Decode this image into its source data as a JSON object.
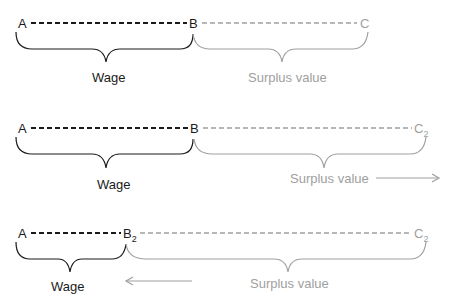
{
  "colors": {
    "wage": "#1a1a1a",
    "surplus": "#a0a0a0"
  },
  "rows": [
    {
      "point_a": "A",
      "point_b": "B",
      "point_b_sub": "",
      "point_c": "C",
      "point_c_sub": "",
      "wage_label": "Wage",
      "surplus_label": "Surplus value",
      "arrow": "none"
    },
    {
      "point_a": "A",
      "point_b": "B",
      "point_b_sub": "",
      "point_c": "C",
      "point_c_sub": "2",
      "wage_label": "Wage",
      "surplus_label": "Surplus value",
      "arrow": "right"
    },
    {
      "point_a": "A",
      "point_b": "B",
      "point_b_sub": "2",
      "point_c": "C",
      "point_c_sub": "2",
      "wage_label": "Wage",
      "surplus_label": "Surplus value",
      "arrow": "left"
    }
  ]
}
